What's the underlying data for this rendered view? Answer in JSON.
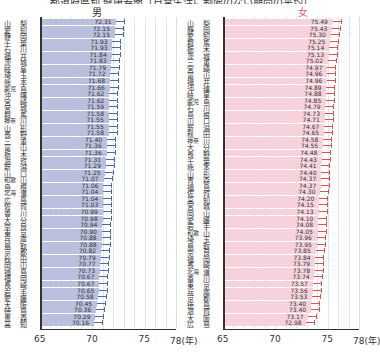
{
  "chart_data": [
    {
      "type": "bar",
      "orientation": "horizontal",
      "title": "男",
      "xlabel": "(年)",
      "xlim": [
        65,
        78
      ],
      "xticks": [
        "65",
        "70",
        "75",
        "78(年)"
      ],
      "bar_color": "#b9bfdc",
      "error_bar_color": "#4a6aa8",
      "categories": [
        "山梨",
        "愛知",
        "静岡",
        "千葉",
        "石川",
        "福井",
        "茨城",
        "岐阜",
        "埼玉",
        "熊本",
        "鹿児島",
        "沖縄",
        "宮崎",
        "宮城",
        "群馬",
        "神奈川",
        "山形",
        "長野",
        "三重",
        "富山",
        "栃木",
        "滋賀",
        "新潟",
        "山口",
        "和歌山",
        "島根",
        "北海道",
        "広島",
        "佐賀",
        "香川",
        "大分",
        "奈良",
        "東京",
        "兵庫",
        "鳥取",
        "京都",
        "秋田",
        "岡山",
        "福島",
        "福岡",
        "長崎",
        "岩手",
        "愛媛",
        "大阪",
        "徳島",
        "青森",
        "高知"
      ],
      "values": [
        72.31,
        72.15,
        72.15,
        71.93,
        71.93,
        71.84,
        71.83,
        71.79,
        71.72,
        71.68,
        71.66,
        71.62,
        71.62,
        71.59,
        71.58,
        71.55,
        71.55,
        71.58,
        71.4,
        71.36,
        71.36,
        71.31,
        71.29,
        71.25,
        71.07,
        71.06,
        71.04,
        71.04,
        71.03,
        70.99,
        70.98,
        70.94,
        70.9,
        70.88,
        70.88,
        70.82,
        70.79,
        70.77,
        70.73,
        70.67,
        70.67,
        70.65,
        70.58,
        70.45,
        70.36,
        70.29,
        70.16
      ]
    },
    {
      "type": "bar",
      "orientation": "horizontal",
      "title": "女",
      "xlabel": "(年)",
      "xlim": [
        65,
        78
      ],
      "xticks": [
        "65",
        "70",
        "75",
        "78(年)"
      ],
      "bar_color": "#f6d3dc",
      "error_bar_color": "#d9534f",
      "categories": [
        "山梨",
        "静岡",
        "愛知",
        "群馬",
        "栃木",
        "茨城",
        "三重",
        "宮崎",
        "富山",
        "福井",
        "沖縄",
        "岐阜",
        "鹿児島",
        "石川",
        "島根",
        "山口",
        "新潟",
        "秋田",
        "神奈川",
        "大分",
        "長野",
        "千葉",
        "熊本",
        "山形",
        "青森",
        "福島",
        "佐賀",
        "高知",
        "宮城",
        "岡山",
        "愛媛",
        "岩手",
        "和歌山",
        "埼玉",
        "鳥取",
        "奈良",
        "福岡",
        "長崎",
        "北海道",
        "香川",
        "東京",
        "兵庫",
        "京都",
        "徳島",
        "滋賀",
        "大阪",
        "広島"
      ],
      "values": [
        75.49,
        75.43,
        75.3,
        75.25,
        75.14,
        75.13,
        75.02,
        74.97,
        74.96,
        74.96,
        74.89,
        74.88,
        74.85,
        74.79,
        74.73,
        74.71,
        74.67,
        74.65,
        74.58,
        74.55,
        74.48,
        74.43,
        74.41,
        74.4,
        74.37,
        74.37,
        74.3,
        74.2,
        74.15,
        74.13,
        74.1,
        74.08,
        74.05,
        73.96,
        73.95,
        73.85,
        73.84,
        73.79,
        73.78,
        73.74,
        73.57,
        73.56,
        73.53,
        73.4,
        73.4,
        73.17,
        72.98
      ]
    }
  ],
  "header": {
    "title_cropped": "都道府県別 健康寿命（日常生活に制限のない期間の平均）"
  },
  "panels": {
    "male": {
      "title": "男"
    },
    "female": {
      "title": "女"
    }
  }
}
